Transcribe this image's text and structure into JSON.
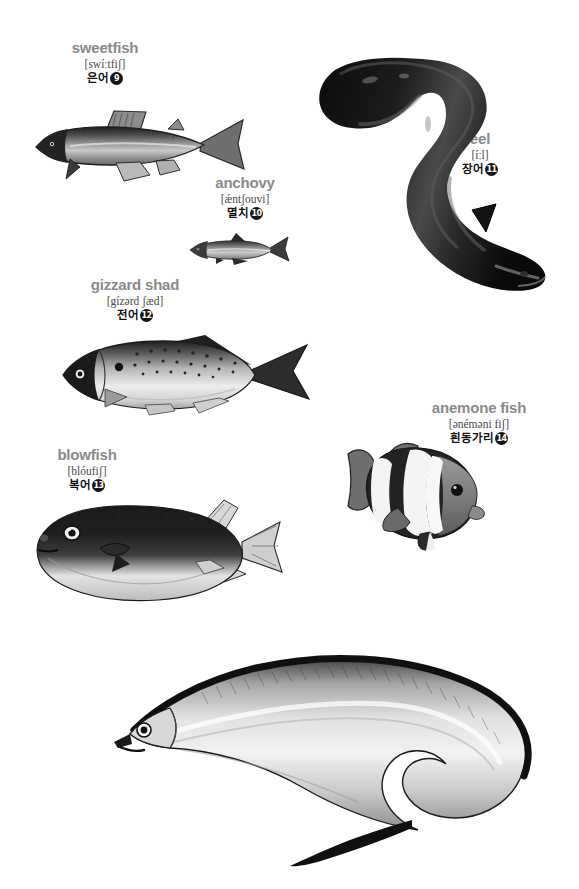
{
  "page": {
    "background_color": "#ffffff",
    "width": 579,
    "height": 889,
    "heading_color": "#8a8a8a",
    "phonetic_color": "#4a4a4a",
    "korean_color": "#111111",
    "badge_color": "#151515"
  },
  "entries": [
    {
      "id": "sweetfish",
      "english": "sweetfish",
      "phonetic": "[swíːtfiʃ]",
      "korean": "은어",
      "number": "9",
      "illustration": "sweetfish-illustration"
    },
    {
      "id": "eel",
      "english": "eel",
      "phonetic": "[íːl]",
      "korean": "장어",
      "number": "11",
      "illustration": "eel-illustration"
    },
    {
      "id": "anchovy",
      "english": "anchovy",
      "phonetic": "[ǽntʃouvi]",
      "korean": "멸치",
      "number": "10",
      "illustration": "anchovy-illustration"
    },
    {
      "id": "gizzard-shad",
      "english": "gizzard shad",
      "phonetic": "[gízərd ʃæd]",
      "korean": "전어",
      "number": "12",
      "illustration": "gizzard-shad-illustration"
    },
    {
      "id": "blowfish",
      "english": "blowfish",
      "phonetic": "[blóufiʃ]",
      "korean": "복어",
      "number": "13",
      "illustration": "blowfish-illustration"
    },
    {
      "id": "anemone-fish",
      "english": "anemone fish",
      "phonetic": "[ənéməni fiʃ]",
      "korean": "흰동가리",
      "number": "14",
      "illustration": "anemone-fish-illustration"
    },
    {
      "id": "cutlassfish",
      "english": "cutlassfish",
      "phonetic": "[kʌ́tləsfiʃ]",
      "korean": "갈치",
      "number": "15",
      "illustration": "cutlassfish-illustration"
    }
  ]
}
